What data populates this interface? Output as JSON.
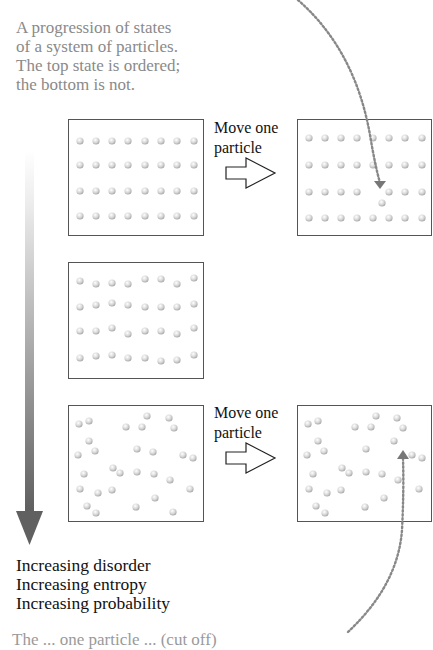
{
  "caption_top": {
    "lines": [
      "A progression of states",
      "of a system of particles.",
      "The top state is ordered;",
      "the bottom is not."
    ]
  },
  "panels": [
    {
      "id": "ordered",
      "row": 1,
      "position": "left",
      "arrangement": "perfect 8x4 grid",
      "particle_count": 32
    },
    {
      "id": "ordered-moved",
      "row": 1,
      "position": "right",
      "arrangement": "8x4 grid with one particle moved out of row 3",
      "particle_count": 32
    },
    {
      "id": "slightly-disordered",
      "row": 2,
      "position": "left",
      "arrangement": "jittered 8x4 grid",
      "particle_count": 32
    },
    {
      "id": "disordered",
      "row": 3,
      "position": "left",
      "arrangement": "random",
      "particle_count": 32
    },
    {
      "id": "disordered-moved",
      "row": 3,
      "position": "right",
      "arrangement": "random with one particle moved",
      "particle_count": 32
    }
  ],
  "transitions": [
    {
      "label_line1": "Move one",
      "label_line2": "particle",
      "from": "ordered",
      "to": "ordered-moved",
      "icon": "hollow-right-arrow"
    },
    {
      "label_line1": "Move one",
      "label_line2": "particle",
      "from": "disordered",
      "to": "disordered-moved",
      "icon": "hollow-right-arrow"
    }
  ],
  "trend_arrow": {
    "direction": "down",
    "gradient_from": "#f2f2f2",
    "gradient_to": "#6a6a6a",
    "labels": [
      "Increasing disorder",
      "Increasing entropy",
      "Increasing probability"
    ]
  },
  "caption_bottom": {
    "text": "The ... one particle ... (cut off)"
  },
  "colors": {
    "box_border": "#555555",
    "particle_fill": "#d8d8d8",
    "dotted_curve": "#888888",
    "caption_gray": "#8a8a8a",
    "label_black": "#111111"
  }
}
